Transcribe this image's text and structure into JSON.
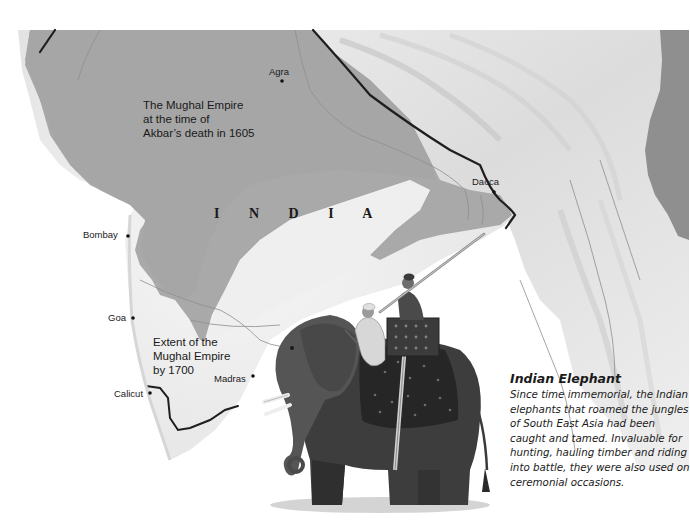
{
  "map": {
    "colors": {
      "background": "#ffffff",
      "empire_1605": "#a8a8a8",
      "empire_1700": "#ececec",
      "terrain_light": "#e4e4e4",
      "terrain_dark": "#8c8c8c",
      "border_line": "#1f1f1f",
      "river_line": "#8a8a8a"
    },
    "country_label": "I N D I A",
    "region_labels": {
      "empire_1605": "The Mughal Empire\nat the time of\nAkbar’s death in 1605",
      "empire_1700": "Extent of the\nMughal Empire\nby 1700"
    },
    "cities": [
      {
        "name": "Agra",
        "label_x": 269,
        "label_y": 66,
        "dot_x": 282,
        "dot_y": 81
      },
      {
        "name": "Dacca",
        "label_x": 472,
        "label_y": 176,
        "dot_x": 494,
        "dot_y": 193
      },
      {
        "name": "Bombay",
        "label_x": 85,
        "label_y": 229,
        "dot_x": 128,
        "dot_y": 236
      },
      {
        "name": "Goa",
        "label_x": 108,
        "label_y": 312,
        "dot_x": 133,
        "dot_y": 318
      },
      {
        "name": "Madras",
        "label_x": 214,
        "label_y": 374,
        "dot_x": 253,
        "dot_y": 376
      },
      {
        "name": "Calicut",
        "label_x": 114,
        "label_y": 388,
        "dot_x": 150,
        "dot_y": 394
      }
    ]
  },
  "caption": {
    "title": "Indian Elephant",
    "body": "Since time immemorial, the Indian elephants that roamed the jungles of South East Asia had been caught and tamed. Invaluable for hunting, hauling timber and riding into battle, they were also used on ceremonial occasions."
  },
  "illustration": {
    "subject": "elephant-with-riders"
  }
}
